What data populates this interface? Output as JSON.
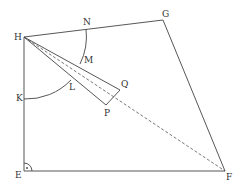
{
  "diagram": {
    "points": {
      "H": {
        "label": "H",
        "x": 24,
        "y": 37,
        "lx": 14,
        "ly": 40
      },
      "N": {
        "label": "N",
        "x": 86,
        "y": 29,
        "lx": 83,
        "ly": 25
      },
      "G": {
        "label": "G",
        "x": 163,
        "y": 20,
        "lx": 162,
        "ly": 17
      },
      "F": {
        "label": "F",
        "x": 225,
        "y": 171,
        "lx": 226,
        "ly": 180
      },
      "E": {
        "label": "E",
        "x": 24,
        "y": 171,
        "lx": 15,
        "ly": 178
      },
      "K": {
        "label": "K",
        "x": 24,
        "y": 99,
        "lx": 16,
        "ly": 101
      },
      "L": {
        "label": "L",
        "x": 70,
        "y": 80,
        "lx": 69,
        "ly": 90
      },
      "M": {
        "label": "M",
        "x": 82,
        "y": 60,
        "lx": 84,
        "ly": 63
      },
      "P": {
        "label": "P",
        "x": 106,
        "y": 105,
        "lx": 104,
        "ly": 116
      },
      "Q": {
        "label": "Q",
        "x": 120,
        "y": 90,
        "lx": 121,
        "ly": 87
      }
    },
    "colors": {
      "stroke": "#444444",
      "text": "#333333",
      "background": "#ffffff"
    }
  }
}
